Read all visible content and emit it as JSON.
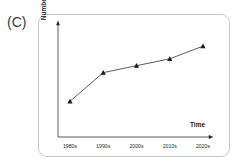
{
  "panel": {
    "letter": "(C)"
  },
  "chart_data": {
    "type": "line",
    "title": "",
    "subtitle": "",
    "xlabel": "Time",
    "ylabel": "Number",
    "categories": [
      "1980s",
      "1990s",
      "2000s",
      "2010s",
      "2020s"
    ],
    "values": [
      0.31,
      0.56,
      0.62,
      0.68,
      0.79
    ],
    "series": [
      {
        "name": "Number",
        "values": [
          0.31,
          0.56,
          0.62,
          0.68,
          0.79
        ],
        "marker": "triangle",
        "marker_color": "#1a1a1a",
        "line_color": "#4a4a4a"
      }
    ],
    "ylim": [
      0,
      1
    ],
    "xlim": [
      0,
      1
    ],
    "grid": false,
    "legend": false,
    "axis_style": "arrow",
    "y_tick_labels": [],
    "x_tick_labels": [
      "1980s",
      "1990s",
      "2000s",
      "2010s",
      "2020s"
    ],
    "annotations": []
  },
  "style": {
    "frame_color": "#c9c9c9",
    "axis_color": "#4a4a4a",
    "text_color": "#1a1a1a",
    "background": "#ffffff"
  }
}
